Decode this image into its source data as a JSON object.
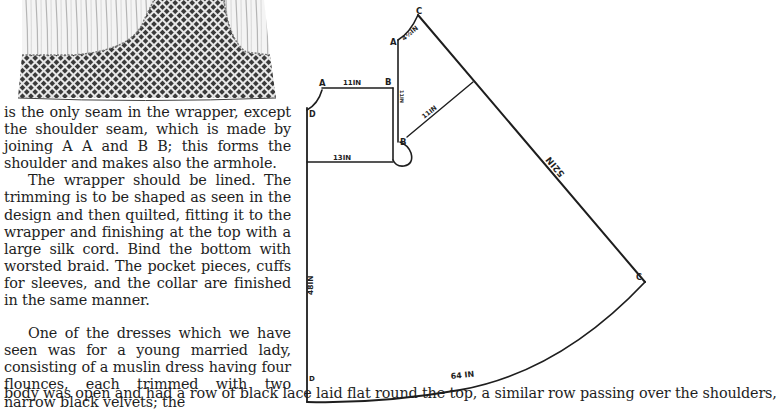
{
  "illustration": {
    "description": "engraving of the lower part of a wrapper with quilted checked trimming",
    "colors": {
      "checks": "#3a3a3a",
      "fabric": "#cfcfcf"
    }
  },
  "text": {
    "paragraphs": [
      {
        "id": "p1",
        "text": "is the only seam in the wrapper, except the shoulder seam, which is made by joining A A and B B; this forms the shoulder and makes also the armhole."
      },
      {
        "id": "p2",
        "text": "The wrapper should be lined. The trimming is to be shaped as seen in the design and then quilted, fitting it to the wrapper and finishing at the top with a large silk cord. Bind the bottom with worsted braid. The pocket pieces, cuffs for sleeves, and the collar are finished in the same manner."
      },
      {
        "id": "p3",
        "text": "One of the dresses which we have seen was for a young married lady, consisting of a muslin dress having four flounces, each trimmed with two narrow black velvets; the"
      }
    ],
    "full_width_line": "body was open and had a row of black lace laid flat round the top, a similar row passing over the shoulders,"
  },
  "diagram": {
    "points": {
      "left_A": "A",
      "left_B": "B",
      "left_D": "D",
      "right_A": "A",
      "right_C_top": "C",
      "right_B": "B",
      "right_C_side": "C",
      "bottom_D": "D"
    },
    "measurements": {
      "shoulder_top": "11IN",
      "waist_left": "13IN",
      "armhole_vertical": "11IN",
      "diagonal_inner": "11IN",
      "shoulder_small": "4½IN",
      "long_side": "52IN",
      "left_length": "48IN",
      "hem": "64 IN"
    }
  }
}
